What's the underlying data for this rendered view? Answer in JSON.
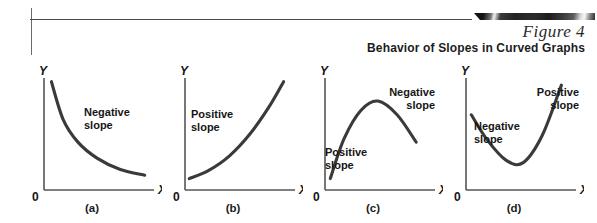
{
  "header": {
    "figure_label": "Figure 4",
    "subtitle": "Behavior of Slopes in Curved Graphs",
    "rule_color": "#4a4a4a",
    "bar_color": "#222222"
  },
  "axes": {
    "y_label": "Y",
    "x_label": "X",
    "origin_label": "0",
    "axis_color": "#555555",
    "curve_color": "#3a3a3a"
  },
  "panels": [
    {
      "caption": "(a)",
      "curve": "decreasing-convex",
      "labels": [
        {
          "name": "negative-slope-label",
          "line1": "Negative",
          "line2": "slope",
          "align": "left",
          "x": 62,
          "y": 44
        }
      ]
    },
    {
      "caption": "(b)",
      "curve": "increasing-convex",
      "labels": [
        {
          "name": "positive-slope-label",
          "line1": "Positive",
          "line2": "slope",
          "align": "left",
          "x": 28,
          "y": 46
        }
      ]
    },
    {
      "caption": "(c)",
      "curve": "concave-down-hill",
      "labels": [
        {
          "name": "negative-slope-label",
          "line1": "Negative",
          "line2": "slope",
          "align": "right",
          "x": 70,
          "y": 24
        },
        {
          "name": "positive-slope-label",
          "line1": "Positive",
          "line2": "slope",
          "align": "left",
          "x": 22,
          "y": 84
        }
      ]
    },
    {
      "caption": "(d)",
      "curve": "convex-up-valley",
      "labels": [
        {
          "name": "positive-slope-label",
          "line1": "Positive",
          "line2": "slope",
          "align": "right",
          "x": 73,
          "y": 24
        },
        {
          "name": "negative-slope-label",
          "line1": "Negative",
          "line2": "slope",
          "align": "left",
          "x": 30,
          "y": 58
        }
      ]
    }
  ],
  "chart_data": {
    "type": "line",
    "title": "Behavior of Slopes in Curved Graphs",
    "xlabel": "X",
    "ylabel": "Y",
    "grid": false,
    "legend": "none",
    "subplots": [
      {
        "caption": "(a)",
        "description": "Downward sloping convex curve, slope negative throughout",
        "annotations": [
          "Negative slope"
        ],
        "points": [
          [
            0.07,
            0.95
          ],
          [
            0.18,
            0.62
          ],
          [
            0.32,
            0.42
          ],
          [
            0.5,
            0.28
          ],
          [
            0.72,
            0.18
          ],
          [
            0.95,
            0.13
          ]
        ]
      },
      {
        "caption": "(b)",
        "description": "Upward sloping convex curve, slope positive throughout",
        "annotations": [
          "Positive slope"
        ],
        "points": [
          [
            0.04,
            0.1
          ],
          [
            0.22,
            0.17
          ],
          [
            0.42,
            0.3
          ],
          [
            0.62,
            0.5
          ],
          [
            0.8,
            0.74
          ],
          [
            0.93,
            0.95
          ]
        ]
      },
      {
        "caption": "(c)",
        "description": "Concave hill: slope positive then negative",
        "annotations": [
          "Positive slope",
          "Negative slope"
        ],
        "points": [
          [
            0.05,
            0.1
          ],
          [
            0.18,
            0.45
          ],
          [
            0.34,
            0.7
          ],
          [
            0.5,
            0.78
          ],
          [
            0.68,
            0.66
          ],
          [
            0.86,
            0.42
          ]
        ]
      },
      {
        "caption": "(d)",
        "description": "Convex valley: slope negative then positive",
        "annotations": [
          "Negative slope",
          "Positive slope"
        ],
        "points": [
          [
            0.05,
            0.66
          ],
          [
            0.2,
            0.44
          ],
          [
            0.38,
            0.26
          ],
          [
            0.54,
            0.24
          ],
          [
            0.72,
            0.48
          ],
          [
            0.9,
            0.92
          ]
        ]
      }
    ]
  }
}
